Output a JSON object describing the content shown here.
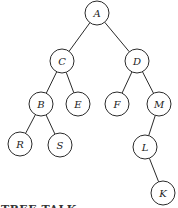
{
  "diagram": {
    "type": "binary-tree",
    "node_radius": 12,
    "colors": {
      "stroke": "#2a2a2a",
      "fill": "#ffffff",
      "text": "#222222"
    },
    "nodes": [
      {
        "id": "A",
        "label": "A",
        "x": 97,
        "y": 13
      },
      {
        "id": "C",
        "label": "C",
        "x": 62,
        "y": 61
      },
      {
        "id": "D",
        "label": "D",
        "x": 137,
        "y": 61
      },
      {
        "id": "B",
        "label": "B",
        "x": 41,
        "y": 104
      },
      {
        "id": "E",
        "label": "E",
        "x": 78,
        "y": 104
      },
      {
        "id": "F",
        "label": "F",
        "x": 117,
        "y": 104
      },
      {
        "id": "M",
        "label": "M",
        "x": 159,
        "y": 104
      },
      {
        "id": "R",
        "label": "R",
        "x": 20,
        "y": 144
      },
      {
        "id": "S",
        "label": "S",
        "x": 60,
        "y": 145
      },
      {
        "id": "L",
        "label": "L",
        "x": 145,
        "y": 147
      },
      {
        "id": "K",
        "label": "K",
        "x": 163,
        "y": 193
      }
    ],
    "edges": [
      [
        "A",
        "C"
      ],
      [
        "A",
        "D"
      ],
      [
        "C",
        "B"
      ],
      [
        "C",
        "E"
      ],
      [
        "D",
        "F"
      ],
      [
        "D",
        "M"
      ],
      [
        "B",
        "R"
      ],
      [
        "B",
        "S"
      ],
      [
        "M",
        "L"
      ],
      [
        "L",
        "K"
      ]
    ]
  },
  "caption": {
    "text": "TREE TALK"
  }
}
